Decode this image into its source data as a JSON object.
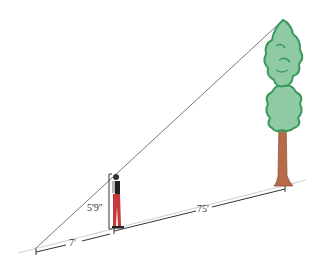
{
  "diagram": {
    "labels": {
      "person_height": "5'9\"",
      "shadow_length": "7'",
      "distance_to_tree": "75'"
    },
    "colors": {
      "ground": "#c8c8c8",
      "dimension": "#333333",
      "sight_line": "#444444",
      "tree_foliage": "#8fcaa4",
      "tree_outline": "#3a9a5e",
      "trunk": "#b56a4a",
      "pants": "#c8383a",
      "vest": "#222222"
    }
  }
}
